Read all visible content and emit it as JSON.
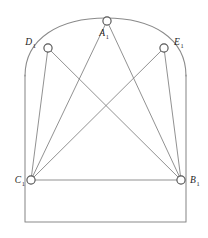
{
  "figure": {
    "background_color": "#ffffff",
    "outline_color": "#8a8a8a",
    "chord_color": "#7d7d7d",
    "marker_fill": "#ffffff",
    "marker_stroke": "#555555",
    "label_color": "#1d1d1d"
  },
  "chart_data": {
    "type": "scatter",
    "title": "",
    "xlabel": "",
    "ylabel": "",
    "grid": false,
    "legend": "none",
    "xlim": [
      0,
      208
    ],
    "ylim": [
      238,
      0
    ],
    "points": [
      {
        "id": "A1",
        "label": "A",
        "subscript": "1",
        "x": 107,
        "y": 21,
        "label_x": 104,
        "label_y": 36,
        "label_anchor": "middle"
      },
      {
        "id": "D1",
        "label": "D",
        "subscript": "1",
        "x": 48,
        "y": 48,
        "label_x": 36,
        "label_y": 45,
        "label_anchor": "end"
      },
      {
        "id": "E1",
        "label": "E",
        "subscript": "1",
        "x": 164,
        "y": 48,
        "label_x": 174,
        "label_y": 45,
        "label_anchor": "start"
      },
      {
        "id": "C1",
        "label": "C",
        "subscript": "1",
        "x": 31,
        "y": 180,
        "label_x": 25,
        "label_y": 183,
        "label_anchor": "end"
      },
      {
        "id": "B1",
        "label": "B",
        "subscript": "1",
        "x": 181,
        "y": 180,
        "label_x": 190,
        "label_y": 183,
        "label_anchor": "start"
      }
    ],
    "edges": [
      {
        "from": "C1",
        "to": "D1"
      },
      {
        "from": "C1",
        "to": "A1"
      },
      {
        "from": "C1",
        "to": "E1"
      },
      {
        "from": "C1",
        "to": "B1"
      },
      {
        "from": "B1",
        "to": "D1"
      },
      {
        "from": "B1",
        "to": "A1"
      },
      {
        "from": "B1",
        "to": "E1"
      }
    ],
    "outline": {
      "rect_left": 25,
      "rect_right": 186,
      "rect_top": 75,
      "rect_bottom": 222,
      "arc_apex_x": 107,
      "arc_apex_y": 18
    }
  },
  "paths": {
    "body_outline": "M 25 75 L 25 222 L 186 222 L 186 75",
    "arc_top": "M 25 76 C 25 38 60 18 106 18 C 152 18 186 38 186 76",
    "chord_c1_d1": "M 31 180 L 48 48",
    "chord_c1_a1": "M 31 180 L 107 21",
    "chord_c1_e1": "M 31 180 L 164 48",
    "chord_c1_b1": "M 31 180 L 181 180",
    "chord_b1_d1": "M 181 180 L 48 48",
    "chord_b1_a1": "M 181 180 L 107 21",
    "chord_b1_e1": "M 181 180 L 164 48"
  },
  "marker_radius": 4.1
}
